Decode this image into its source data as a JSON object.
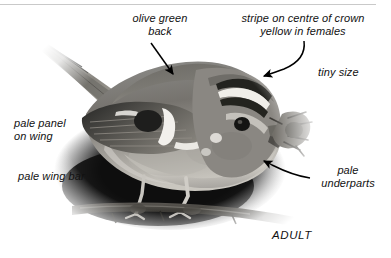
{
  "figure": {
    "kind": "annotated-bird-photograph",
    "background_color": "#ffffff",
    "ink_color": "#111111",
    "rule_color": "#c9c9c9"
  },
  "annotations": {
    "olive_green_back": "olive green\nback",
    "crown_stripe": "stripe on centre of crown\nyellow in females",
    "tiny_size": "tiny size",
    "pale_panel_on_wing": "pale panel\non wing",
    "pale_wing_bar": "pale wing bar",
    "pale_underparts": "pale\nunderparts",
    "age_caption": "ADULT"
  },
  "arrows": [
    {
      "name": "arrow-to-back",
      "style": "straight",
      "from": [
        152,
        44
      ],
      "to": [
        174,
        76
      ]
    },
    {
      "name": "arrow-to-crown-stripe",
      "style": "curved",
      "from": [
        303,
        44
      ],
      "to": [
        263,
        76
      ]
    },
    {
      "name": "arrow-to-underparts",
      "style": "curved",
      "from": [
        307,
        178
      ],
      "to": [
        264,
        161
      ]
    }
  ],
  "photo_parts": [
    {
      "name": "tail",
      "label": "tail"
    },
    {
      "name": "wing",
      "label": "wing with dark patch and pale wing bar"
    },
    {
      "name": "body",
      "label": "olive-green back, pale underparts"
    },
    {
      "name": "head",
      "label": "head with crown stripe and dark eye"
    },
    {
      "name": "bill-with-prey",
      "label": "bill holding insect prey"
    },
    {
      "name": "legs",
      "label": "legs gripping branch"
    },
    {
      "name": "branch",
      "label": "perch branch"
    },
    {
      "name": "shadow",
      "label": "dark background shadow"
    }
  ]
}
